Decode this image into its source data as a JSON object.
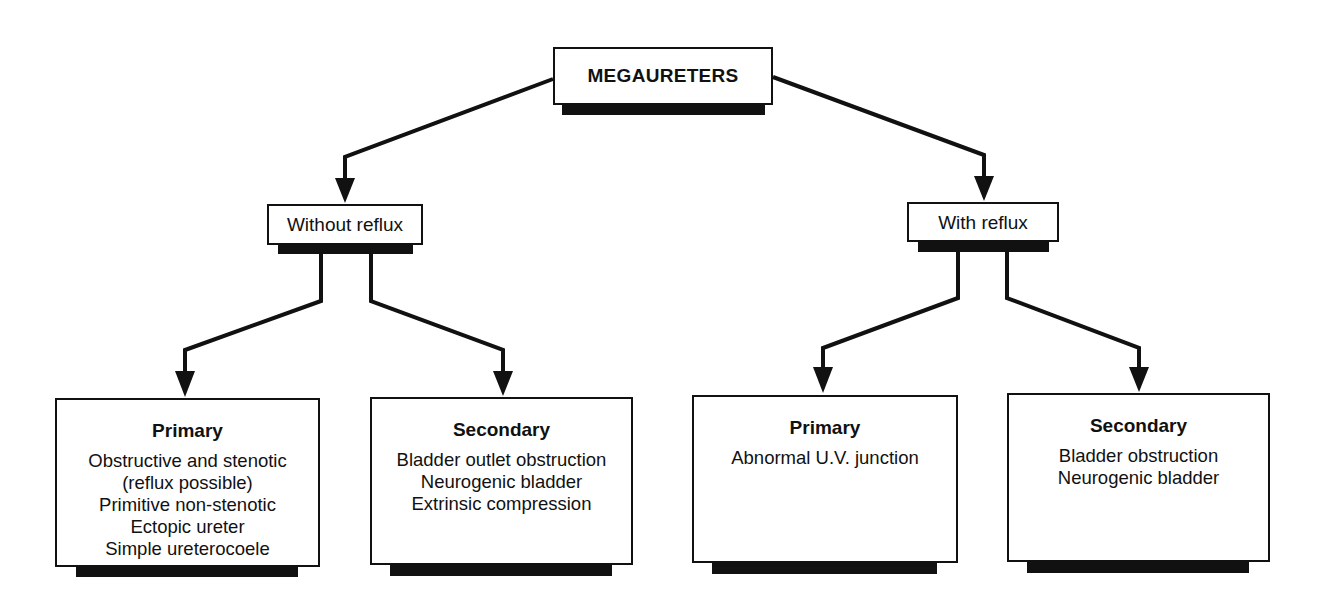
{
  "diagram": {
    "type": "tree",
    "root": {
      "label": "MEGAURETERS"
    },
    "branches": [
      {
        "label": "Without reflux",
        "children": [
          {
            "title": "Primary",
            "items": [
              "Obstructive and stenotic",
              "(reflux possible)",
              "Primitive non-stenotic",
              "Ectopic ureter",
              "Simple ureterocoele"
            ]
          },
          {
            "title": "Secondary",
            "items": [
              "Bladder outlet obstruction",
              "Neurogenic bladder",
              "Extrinsic compression"
            ]
          }
        ]
      },
      {
        "label": "With reflux",
        "children": [
          {
            "title": "Primary",
            "items": [
              "Abnormal U.V. junction"
            ]
          },
          {
            "title": "Secondary",
            "items": [
              "Bladder obstruction",
              "Neurogenic bladder"
            ]
          }
        ]
      }
    ],
    "colors": {
      "line": "#111111",
      "box_fill": "#ffffff",
      "shadow": "#111111"
    }
  }
}
